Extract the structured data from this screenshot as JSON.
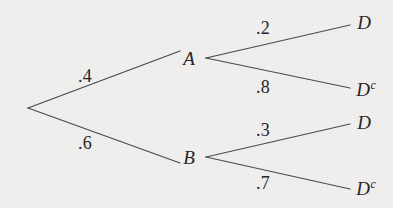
{
  "figure": {
    "name": "probability-tree-diagram",
    "background_color": "#f1f0ee",
    "line_color": "#4a4a50",
    "text_color": "#26262a"
  },
  "chart_data": {
    "type": "diagram",
    "title": "",
    "xlabel": "",
    "ylabel": "",
    "diagram_kind": "probability-tree",
    "root": {
      "label": "",
      "x": 28,
      "y": 108
    },
    "stage1": {
      "nodes": [
        {
          "id": "A",
          "label": "A",
          "x": 189,
          "y": 58,
          "edge_x": 206,
          "edge_y": 58,
          "probability": ".4"
        },
        {
          "id": "B",
          "label": "B",
          "x": 189,
          "y": 157,
          "edge_x": 206,
          "edge_y": 157,
          "probability": ".6"
        }
      ]
    },
    "stage2": {
      "nodes": [
        {
          "id": "A-D",
          "parent": "A",
          "label": "D",
          "superscript": "",
          "x": 364,
          "y": 22,
          "tip_x": 350,
          "tip_y": 25,
          "probability": ".2"
        },
        {
          "id": "A-Dc",
          "parent": "A",
          "label": "D",
          "superscript": "c",
          "x": 366,
          "y": 89,
          "tip_x": 350,
          "tip_y": 88,
          "probability": ".8"
        },
        {
          "id": "B-D",
          "parent": "B",
          "label": "D",
          "superscript": "",
          "x": 364,
          "y": 122,
          "tip_x": 350,
          "tip_y": 124,
          "probability": ".3"
        },
        {
          "id": "B-Dc",
          "parent": "B",
          "label": "D",
          "superscript": "c",
          "x": 366,
          "y": 188,
          "tip_x": 350,
          "tip_y": 189,
          "probability": ".7"
        }
      ]
    },
    "edge_labels": [
      {
        "id": "p-A",
        "text": ".4",
        "x": 85,
        "y": 76
      },
      {
        "id": "p-B",
        "text": ".6",
        "x": 85,
        "y": 143
      },
      {
        "id": "p-A-D",
        "text": ".2",
        "x": 263,
        "y": 28
      },
      {
        "id": "p-A-Dc",
        "text": ".8",
        "x": 263,
        "y": 87
      },
      {
        "id": "p-B-D",
        "text": ".3",
        "x": 263,
        "y": 130
      },
      {
        "id": "p-B-Dc",
        "text": ".7",
        "x": 263,
        "y": 183
      }
    ],
    "edges": [
      {
        "id": "root-A",
        "from": [
          28,
          108
        ],
        "to": [
          180,
          51
        ],
        "label": ".4"
      },
      {
        "id": "root-B",
        "from": [
          28,
          108
        ],
        "to": [
          180,
          163
        ],
        "label": ".6"
      },
      {
        "id": "A-to-D",
        "from": [
          206,
          58
        ],
        "to": [
          350,
          25
        ],
        "label": ".2"
      },
      {
        "id": "A-to-Dc",
        "from": [
          206,
          58
        ],
        "to": [
          350,
          88
        ],
        "label": ".8"
      },
      {
        "id": "B-to-D",
        "from": [
          206,
          157
        ],
        "to": [
          350,
          124
        ],
        "label": ".3"
      },
      {
        "id": "B-to-Dc",
        "from": [
          206,
          157
        ],
        "to": [
          350,
          189
        ],
        "label": ".7"
      }
    ]
  }
}
